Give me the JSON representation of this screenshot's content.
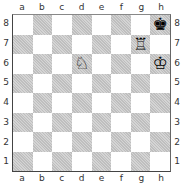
{
  "files": [
    "a",
    "b",
    "c",
    "d",
    "e",
    "f",
    "g",
    "h"
  ],
  "ranks": [
    "8",
    "7",
    "6",
    "5",
    "4",
    "3",
    "2",
    "1"
  ],
  "pieces": [
    {
      "square": "h8",
      "glyph": "♚",
      "name": "black-king",
      "color": "#000000"
    },
    {
      "square": "g7",
      "glyph": "♖",
      "name": "white-rook",
      "color": "#000000"
    },
    {
      "square": "d6",
      "glyph": "♘",
      "name": "white-knight",
      "color": "#000000"
    },
    {
      "square": "h6",
      "glyph": "♔",
      "name": "white-king",
      "color": "#000000"
    }
  ]
}
